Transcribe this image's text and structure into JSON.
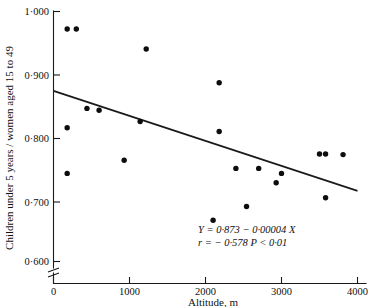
{
  "figure": {
    "background_color": "#ffffff",
    "ink_color": "#111111"
  },
  "chart_data": {
    "type": "scatter",
    "title": "",
    "xlabel": "Altitude, m",
    "ylabel": "Children under 5 years / women aged 15 to 49",
    "xlim": [
      0,
      4000
    ],
    "ylim": [
      0.6,
      1.0
    ],
    "grid": false,
    "legend": "none",
    "y_axis_break": true,
    "x_ticks": [
      0,
      1000,
      2000,
      3000,
      4000
    ],
    "x_tick_labels": [
      "0",
      "1000",
      "2000",
      "3000",
      "4000"
    ],
    "y_ticks": [
      0.6,
      0.7,
      0.8,
      0.9,
      1.0
    ],
    "y_tick_labels": [
      "0·600",
      "0·700",
      "0·800",
      "0·900",
      "1·000"
    ],
    "x": [
      180,
      300,
      180,
      180,
      440,
      600,
      1220,
      930,
      1140,
      2180,
      2180,
      2100,
      2400,
      2540,
      2700,
      2930,
      3000,
      3500,
      3580,
      3580,
      3810
    ],
    "y": [
      0.972,
      0.972,
      0.814,
      0.741,
      0.845,
      0.842,
      0.94,
      0.762,
      0.824,
      0.886,
      0.808,
      0.666,
      0.749,
      0.688,
      0.749,
      0.726,
      0.741,
      0.772,
      0.772,
      0.702,
      0.771
    ],
    "points": [
      {
        "x": 180,
        "y": 0.972
      },
      {
        "x": 300,
        "y": 0.972
      },
      {
        "x": 180,
        "y": 0.814
      },
      {
        "x": 180,
        "y": 0.741
      },
      {
        "x": 440,
        "y": 0.845
      },
      {
        "x": 600,
        "y": 0.842
      },
      {
        "x": 930,
        "y": 0.762
      },
      {
        "x": 1140,
        "y": 0.824
      },
      {
        "x": 1220,
        "y": 0.94
      },
      {
        "x": 2100,
        "y": 0.666
      },
      {
        "x": 2180,
        "y": 0.886
      },
      {
        "x": 2180,
        "y": 0.808
      },
      {
        "x": 2400,
        "y": 0.749
      },
      {
        "x": 2540,
        "y": 0.688
      },
      {
        "x": 2700,
        "y": 0.749
      },
      {
        "x": 2930,
        "y": 0.726
      },
      {
        "x": 3000,
        "y": 0.741
      },
      {
        "x": 3500,
        "y": 0.772
      },
      {
        "x": 3580,
        "y": 0.772
      },
      {
        "x": 3580,
        "y": 0.702
      },
      {
        "x": 3810,
        "y": 0.771
      }
    ],
    "fit_line": {
      "intercept": 0.873,
      "slope": -4e-05,
      "x_start": 0,
      "x_end": 4000,
      "y_start": 0.873,
      "y_end": 0.713
    },
    "annotations": {
      "equation": "Y = 0·873 − 0·00004 X",
      "statistics": "r = − 0·578 P < 0·01"
    }
  }
}
